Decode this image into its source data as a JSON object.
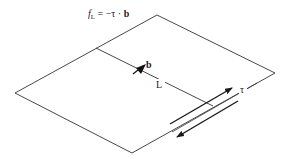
{
  "figure": {
    "formula": {
      "f": "f",
      "sub": "L",
      "rhs": " = −τ · ",
      "b": "b"
    },
    "labels": {
      "burgers_vector": "b",
      "line_length": "L",
      "shear_stress": "τ"
    },
    "colors": {
      "line": "#333333",
      "arrow": "#1a1a1a",
      "background": "#ffffff"
    }
  }
}
